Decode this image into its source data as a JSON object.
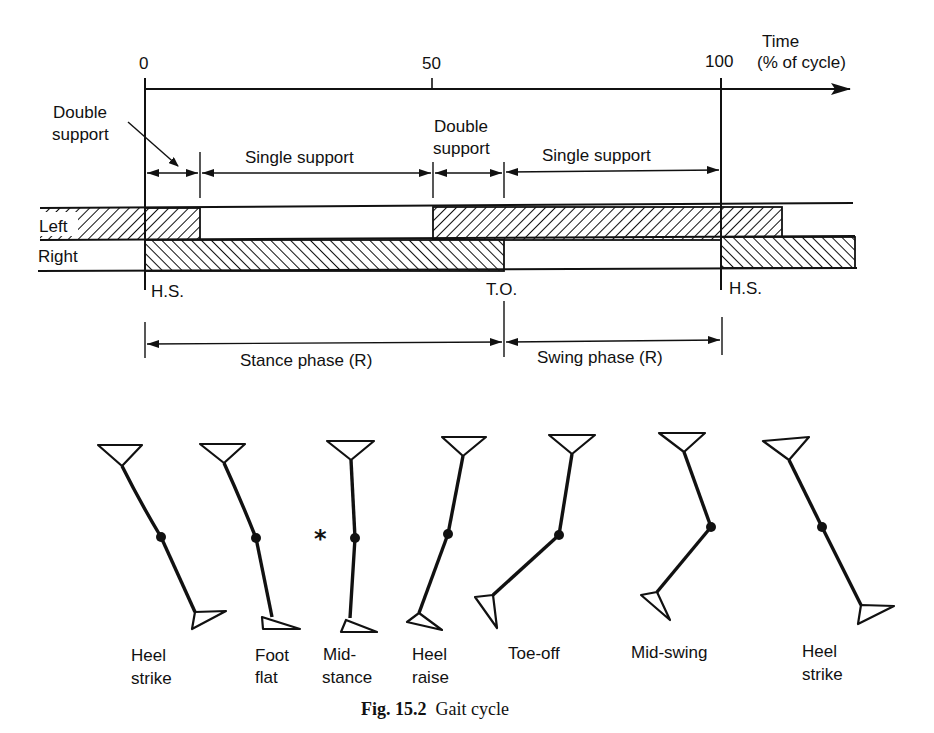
{
  "timeline": {
    "ticks": [
      {
        "label": "0",
        "x": 145
      },
      {
        "label": "50",
        "x": 432
      },
      {
        "label": "100",
        "x": 721
      }
    ],
    "axis_label_line1": "Time",
    "axis_label_line2": "(% of cycle)"
  },
  "phases": {
    "double_support_1_line1": "Double",
    "double_support_1_line2": "support",
    "single_support_1": "Single support",
    "double_support_2_line1": "Double",
    "double_support_2_line2": "support",
    "single_support_2": "Single support"
  },
  "bars": {
    "left_label": "Left",
    "right_label": "Right",
    "left_stance_segments_pct": [
      [
        0,
        10
      ],
      [
        50,
        100
      ],
      [
        100,
        110
      ]
    ],
    "right_stance_segments_pct": [
      [
        0,
        62
      ],
      [
        100,
        110
      ]
    ]
  },
  "events": {
    "hs1": "H.S.",
    "to": "T.O.",
    "hs2": "H.S."
  },
  "right_leg_phases": {
    "stance": "Stance phase (R)",
    "swing": "Swing phase (R)"
  },
  "poses": [
    {
      "line1": "Heel",
      "line2": "strike"
    },
    {
      "line1": "Foot",
      "line2": "flat"
    },
    {
      "line1": "Mid-",
      "line2": "stance"
    },
    {
      "line1": "Heel",
      "line2": "raise"
    },
    {
      "line1": "Toe-off",
      "line2": ""
    },
    {
      "line1": "Mid-swing",
      "line2": ""
    },
    {
      "line1": "Heel",
      "line2": "strike"
    }
  ],
  "midstance_marker": "*",
  "caption": {
    "number": "Fig. 15.2",
    "title": "Gait cycle"
  }
}
